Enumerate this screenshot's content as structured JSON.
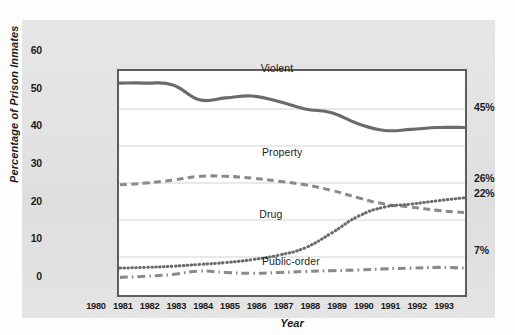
{
  "chart_data": {
    "type": "line",
    "title": "",
    "xlabel": "Year",
    "ylabel": "Percentage of Prison Inmates",
    "xlim": [
      1980,
      1993
    ],
    "ylim": [
      0,
      60
    ],
    "ytick_labels": [
      "0",
      "10",
      "20",
      "30",
      "40",
      "50",
      "60"
    ],
    "ytick_values": [
      0,
      10,
      20,
      30,
      40,
      50,
      60
    ],
    "grid": "horizontal",
    "legend_position": "inline-annotations",
    "categories": [
      "1980",
      "1981",
      "1982",
      "1983",
      "1984",
      "1985",
      "1986",
      "1987",
      "1988",
      "1989",
      "1990",
      "1991",
      "1992",
      "1993"
    ],
    "series": [
      {
        "name": "Violent",
        "style": "solid",
        "color": "#6b6b6b",
        "end_value_label": "45%",
        "values": [
          57,
          57,
          56.5,
          52.5,
          53,
          53.5,
          52,
          50,
          49,
          46,
          44.2,
          44.5,
          45,
          45
        ]
      },
      {
        "name": "Property",
        "style": "dashed",
        "color": "#8a8a8a",
        "end_value_label": "22%",
        "values": [
          29.5,
          30,
          30.8,
          31.8,
          31.8,
          31.3,
          30.5,
          29.5,
          28,
          26,
          24.3,
          23.5,
          22.6,
          22
        ]
      },
      {
        "name": "Drug",
        "style": "dotted",
        "color": "#6b6b6b",
        "end_value_label": "26%",
        "values": [
          7,
          7.2,
          7.5,
          8,
          8.5,
          9.3,
          10.5,
          12.5,
          16.5,
          21,
          23.5,
          24.3,
          25.2,
          26
        ]
      },
      {
        "name": "Public-order",
        "style": "dashdot",
        "color": "#8a8a8a",
        "end_value_label": "7%",
        "values": [
          4.5,
          4.8,
          5.3,
          6.2,
          5.8,
          5.6,
          5.8,
          6.1,
          6.3,
          6.5,
          6.8,
          7,
          7.2,
          7
        ]
      }
    ],
    "end_labels": [
      {
        "text": "45%",
        "value": 45
      },
      {
        "text": "26%",
        "value": 26
      },
      {
        "text": "22%",
        "value": 22
      },
      {
        "text": "7%",
        "value": 7
      }
    ],
    "annotations": [
      {
        "text": "Violent",
        "x": 1986.15,
        "y": 54.9
      },
      {
        "text": "Property",
        "x": 1986.2,
        "y": 32.6
      },
      {
        "text": "Drug",
        "x": 1986.1,
        "y": 16.2
      },
      {
        "text": "Public-order",
        "x": 1986.2,
        "y": 3.6
      }
    ]
  }
}
